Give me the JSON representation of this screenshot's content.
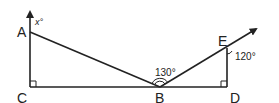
{
  "diagram": {
    "type": "geometry",
    "stroke_color": "#222222",
    "points": {
      "A": {
        "label": "A",
        "x": 30,
        "y": 32
      },
      "B": {
        "label": "B",
        "x": 160,
        "y": 87
      },
      "C": {
        "label": "C",
        "x": 30,
        "y": 87
      },
      "D": {
        "label": "D",
        "x": 227,
        "y": 87
      },
      "E": {
        "label": "E",
        "x": 227,
        "y": 48
      }
    },
    "segments": [
      "CA (ray upward with arrow)",
      "AB",
      "CB",
      "BD",
      "DE",
      "BE (ray with arrow)"
    ],
    "angles": {
      "x_label": "x°",
      "abe_label": "130°",
      "bed_label": "120°"
    },
    "right_angles": [
      "C",
      "D"
    ]
  }
}
